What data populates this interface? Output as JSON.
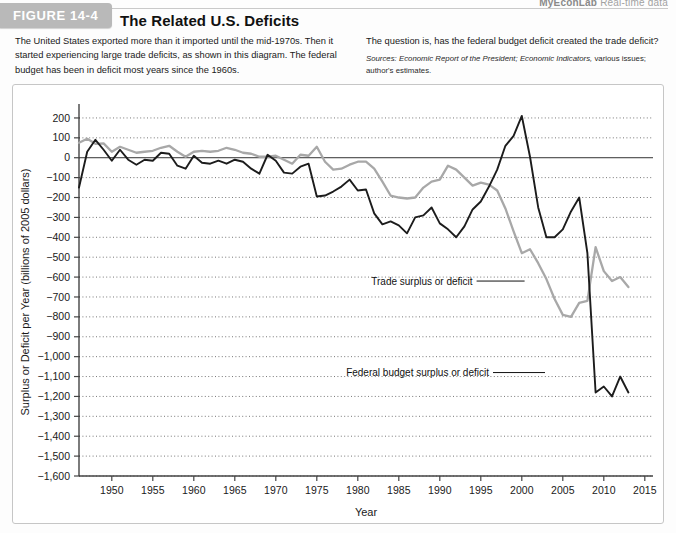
{
  "branding": {
    "logo": "MyEconLab",
    "tagline": "Real-time data"
  },
  "figure": {
    "tab_label": "FIGURE 14-4",
    "title": "The Related U.S. Deficits",
    "description_left": "The United States exported more than it imported until the mid-1970s. Then it started experiencing large trade deficits, as shown in this diagram. The federal budget has been in deficit most years since the 1960s.",
    "description_right": "The question is, has the federal budget deficit created the trade deficit?",
    "sources_label": "Sources:",
    "sources_italic_1": "Economic Report of the President;",
    "sources_italic_2": "Economic Indicators,",
    "sources_rest": "various issues; author's estimates."
  },
  "chart_data": {
    "type": "line",
    "title": "The Related U.S. Deficits",
    "xlabel": "Year",
    "ylabel": "Surplus or Deficit per Year (billions of 2005 dollars)",
    "xlim": [
      1946,
      2016
    ],
    "ylim": [
      -1600,
      250
    ],
    "grid": true,
    "xticks": [
      1950,
      1955,
      1960,
      1965,
      1970,
      1975,
      1980,
      1985,
      1990,
      1995,
      2000,
      2005,
      2010,
      2015
    ],
    "yticks": [
      200,
      100,
      0,
      -100,
      -200,
      -300,
      -400,
      -500,
      -600,
      -700,
      -800,
      -900,
      -1000,
      -1100,
      -1200,
      -1300,
      -1400,
      -1500,
      -1600
    ],
    "ytick_labels": [
      "200",
      "100",
      "0",
      "−100",
      "−200",
      "−300",
      "−400",
      "−500",
      "−600",
      "−700",
      "−800",
      "−900",
      "−1,000",
      "−1,100",
      "−1,200",
      "−1,300",
      "−1,400",
      "−1,500",
      "−1,600"
    ],
    "legend_position": "inline-annotation",
    "series": [
      {
        "name": "Trade surplus or deficit",
        "color": "#a8a8a8",
        "annotation": "Trade surplus or deficit",
        "x": [
          1946,
          1947,
          1948,
          1949,
          1950,
          1951,
          1952,
          1953,
          1954,
          1955,
          1956,
          1957,
          1958,
          1959,
          1960,
          1961,
          1962,
          1963,
          1964,
          1965,
          1966,
          1967,
          1968,
          1969,
          1970,
          1971,
          1972,
          1973,
          1974,
          1975,
          1976,
          1977,
          1978,
          1979,
          1980,
          1981,
          1982,
          1983,
          1984,
          1985,
          1986,
          1987,
          1988,
          1989,
          1990,
          1991,
          1992,
          1993,
          1994,
          1995,
          1996,
          1997,
          1998,
          1999,
          2000,
          2001,
          2002,
          2003,
          2004,
          2005,
          2006,
          2007,
          2008,
          2009,
          2010,
          2011,
          2012,
          2013
        ],
        "values": [
          75,
          95,
          70,
          72,
          30,
          55,
          40,
          25,
          30,
          35,
          50,
          60,
          30,
          5,
          30,
          35,
          30,
          35,
          50,
          40,
          25,
          20,
          5,
          5,
          10,
          -10,
          -30,
          15,
          10,
          55,
          -20,
          -60,
          -55,
          -35,
          -20,
          -20,
          -55,
          -120,
          -190,
          -200,
          -205,
          -200,
          -150,
          -120,
          -110,
          -40,
          -60,
          -100,
          -140,
          -125,
          -135,
          -165,
          -255,
          -370,
          -480,
          -460,
          -530,
          -610,
          -710,
          -790,
          -800,
          -730,
          -720,
          -450,
          -570,
          -620,
          -600,
          -650
        ]
      },
      {
        "name": "Federal budget surplus or deficit",
        "color": "#1c1c1c",
        "annotation": "Federal budget surplus or deficit",
        "x": [
          1946,
          1947,
          1948,
          1949,
          1950,
          1951,
          1952,
          1953,
          1954,
          1955,
          1956,
          1957,
          1958,
          1959,
          1960,
          1961,
          1962,
          1963,
          1964,
          1965,
          1966,
          1967,
          1968,
          1969,
          1970,
          1971,
          1972,
          1973,
          1974,
          1975,
          1976,
          1977,
          1978,
          1979,
          1980,
          1981,
          1982,
          1983,
          1984,
          1985,
          1986,
          1987,
          1988,
          1989,
          1990,
          1991,
          1992,
          1993,
          1994,
          1995,
          1996,
          1997,
          1998,
          1999,
          2000,
          2001,
          2002,
          2003,
          2004,
          2005,
          2006,
          2007,
          2008,
          2009,
          2010,
          2011,
          2012,
          2013
        ],
        "values": [
          -150,
          30,
          90,
          40,
          -15,
          40,
          -10,
          -35,
          -10,
          -15,
          25,
          20,
          -40,
          -55,
          10,
          -25,
          -30,
          -15,
          -30,
          -10,
          -20,
          -55,
          -80,
          15,
          -15,
          -75,
          -80,
          -45,
          -30,
          -195,
          -190,
          -170,
          -145,
          -110,
          -165,
          -160,
          -280,
          -335,
          -320,
          -340,
          -380,
          -300,
          -290,
          -250,
          -330,
          -360,
          -400,
          -345,
          -260,
          -220,
          -145,
          -60,
          60,
          110,
          210,
          5,
          -250,
          -400,
          -400,
          -360,
          -270,
          -200,
          -480,
          -1180,
          -1150,
          -1200,
          -1100,
          -1180
        ]
      }
    ],
    "annotations": [
      {
        "text": "Trade surplus or deficit",
        "x": 1994,
        "y": -620
      },
      {
        "text": "Federal budget surplus or deficit",
        "x": 1996,
        "y": -1080
      }
    ]
  }
}
